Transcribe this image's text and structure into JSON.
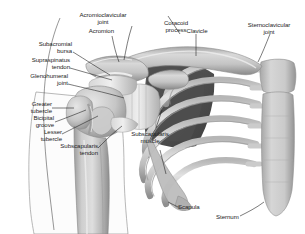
{
  "figure": {
    "background_color": "#ffffff",
    "bone_color": "#c9c9c9",
    "bone_shadow_color": "#8e8e8e",
    "muscle_dark_color": "#555555",
    "label_color": "#1c1c1c",
    "leader_color": "#2b2b2b"
  },
  "labels": {
    "acromioclavicular_joint": "Acromioclavicular\njoint",
    "acromion": "Acromion",
    "subacromial_bursa": "Subacromial\nbursa",
    "supraspinatus_tendon": "Supraspinatus\ntendon",
    "glenohumeral_joint": "Glenohumeral\njoint",
    "greater_tubercle": "Greater\ntubercle",
    "bicipital_groove": "Bicipital\ngroove",
    "lesser_tubercle": "Lesser\ntubercle",
    "subscapularis_tendon": "Subscapularis\ntendon",
    "coracoid_process": "Coracoid\nprocess",
    "clavicle": "Clavicle",
    "sternoclavicular_joint": "Sternoclavicular\njoint",
    "subscapularis_muscle": "Subscapularis\nmuscle",
    "scapula": "Scapula",
    "sternum": "Sternum"
  }
}
